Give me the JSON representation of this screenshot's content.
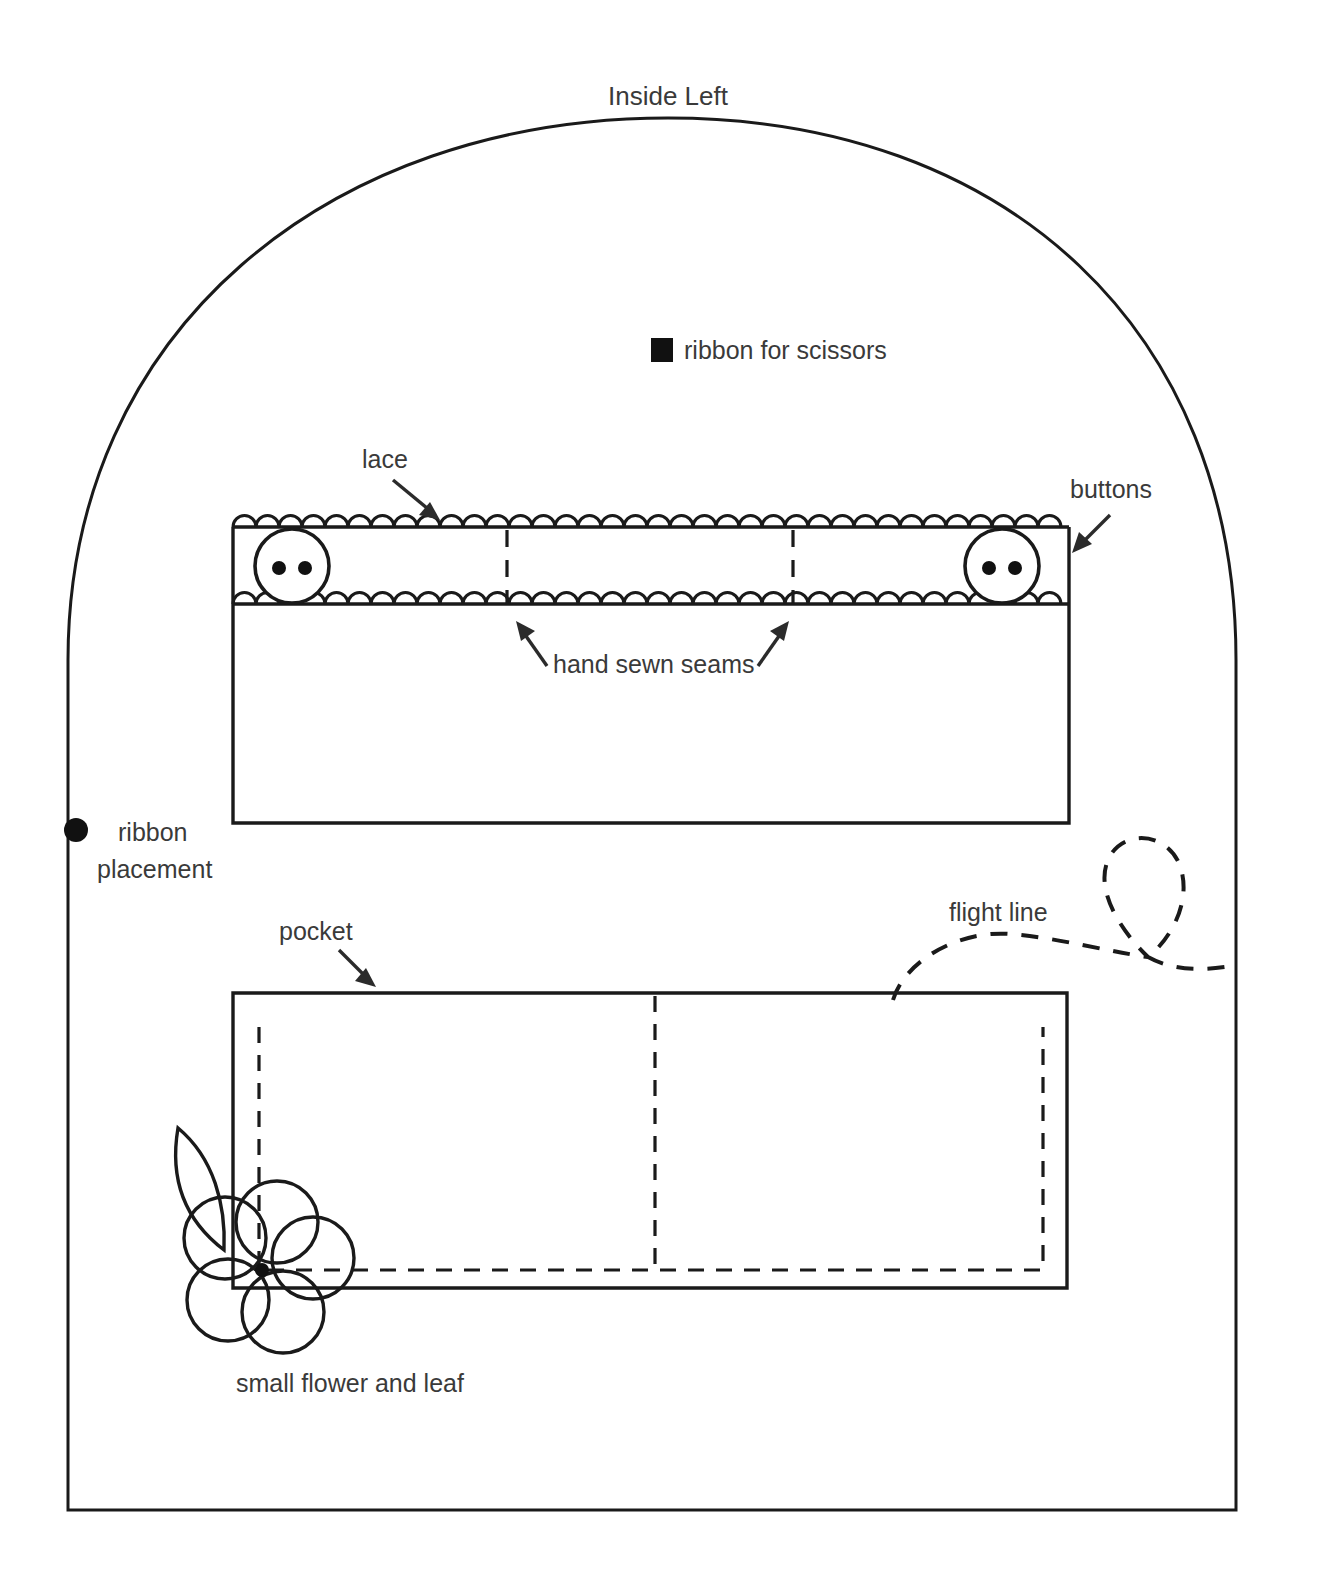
{
  "document": {
    "title": "Inside Left",
    "background_color": "#ffffff",
    "ink_color": "#1a1a1a",
    "text_color": "#3a3a3a"
  },
  "legend": [
    {
      "id": "ribbon-for-scissors",
      "marker": "filled-square-marker",
      "label": "ribbon for scissors",
      "marker_color": "#111111"
    },
    {
      "id": "ribbon-placement",
      "marker": "filled-circle-marker",
      "label_line_1": "ribbon",
      "label_line_2": "placement",
      "marker_color": "#111111"
    }
  ],
  "annotations": {
    "lace": "lace",
    "buttons": "buttons",
    "hand_sewn_seams": "hand sewn seams",
    "pocket": "pocket",
    "flight_line": "flight line",
    "small_flower_and_leaf": "small flower and leaf"
  },
  "shapes": {
    "outline": {
      "name": "arched-pattern-outline",
      "left_x": 68,
      "right_x": 1236,
      "bottom_y": 1510,
      "arch_apex_y": 118,
      "shoulder_y": 640
    },
    "upper_panel": {
      "name": "needle-book-band-panel",
      "left_x": 233,
      "right_x": 1069,
      "top_y": 527,
      "bottom_y": 823,
      "band_bottom_y": 604,
      "divider_x": [
        507,
        793
      ],
      "buttons": [
        {
          "cx": 292,
          "cy": 566,
          "r": 37
        },
        {
          "cx": 1002,
          "cy": 566,
          "r": 37
        }
      ],
      "lace_rows_y": [
        527,
        604
      ],
      "scallop_width": 23
    },
    "pocket": {
      "name": "pocket-panel",
      "left_x": 233,
      "right_x": 1067,
      "top_y": 993,
      "bottom_y": 1288,
      "stitch_inset_left_x": 259,
      "stitch_inset_right_x": 1043,
      "stitch_bottom_y": 1270,
      "stitch_top_y": 1027,
      "divider_x": 655
    },
    "flight_line": {
      "name": "flight-line-path",
      "start": [
        893,
        1000
      ],
      "loop_center": [
        1140,
        880
      ],
      "end": [
        1232,
        968
      ]
    },
    "flower": {
      "name": "small-flower-and-leaf",
      "center": [
        264,
        1272
      ],
      "petal_count": 5,
      "petal_radius": 41,
      "leaf_tip": [
        178,
        1128
      ]
    }
  }
}
